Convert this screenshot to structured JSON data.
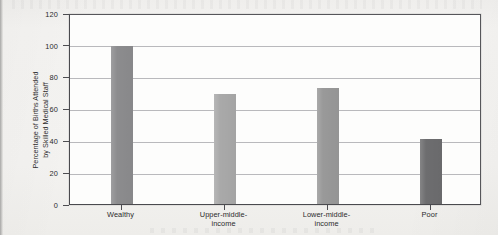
{
  "figure": {
    "background_color": "#f2f1ef",
    "plot_background_color": "#fdfdfc",
    "frame_color": "#4a4a4e",
    "gridline_color": "#b9b9bc"
  },
  "chart_data": {
    "type": "bar",
    "title": "",
    "subtitle": "",
    "xlabel": "",
    "ylabel": "Percentage of Births Attended by Skilled Medical Staff",
    "ylabel_line1": "Percentage of Births Attended",
    "ylabel_line2": "by Skilled Medical Staff",
    "categories": [
      "Wealthy",
      "Upper-middle-income",
      "Lower-middle-income",
      "Poor"
    ],
    "category_lines": [
      [
        "Wealthy"
      ],
      [
        "Upper-middle-",
        "income"
      ],
      [
        "Lower-middle-",
        "income"
      ],
      [
        "Poor"
      ]
    ],
    "values": [
      99,
      69,
      73,
      41
    ],
    "bar_colors": [
      "#8c8c8e",
      "#a9a9a9",
      "#999999",
      "#6d6d6f"
    ],
    "ylim": [
      0,
      120
    ],
    "ytick_values": [
      0,
      20,
      40,
      60,
      80,
      100,
      120
    ],
    "ytick_labels": [
      "0",
      "20",
      "40",
      "60",
      "80",
      "100",
      "120"
    ],
    "grid": "horizontal",
    "legend": "none",
    "legend_position": "none",
    "orientation": "vertical"
  }
}
